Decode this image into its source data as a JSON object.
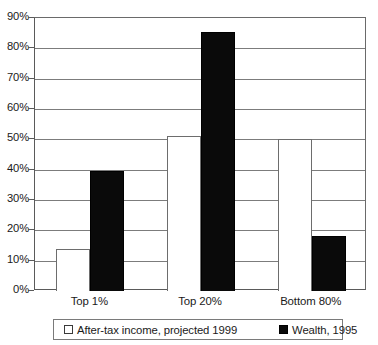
{
  "chart_data": {
    "type": "bar",
    "title": "",
    "subtitle": "",
    "xlabel": "",
    "ylabel": "",
    "categories": [
      "Top 1%",
      "Top 20%",
      "Bottom 80%"
    ],
    "series": [
      {
        "name": "After-tax income, projected 1999",
        "color": "#ffffff",
        "values": [
          14,
          51,
          50
        ]
      },
      {
        "name": "Wealth, 1995",
        "color": "#000000",
        "values": [
          39.5,
          85.5,
          18
        ]
      }
    ],
    "ylim": [
      0,
      90
    ],
    "ytick_values": [
      0,
      10,
      20,
      30,
      40,
      50,
      60,
      70,
      80,
      90
    ],
    "ytick_labels": [
      "0%",
      "10%",
      "20%",
      "30%",
      "40%",
      "50%",
      "60%",
      "70%",
      "80%",
      "90%"
    ],
    "grid": true,
    "legend_position": "bottom"
  },
  "legend": {
    "entries": [
      {
        "label": "After-tax income,  projected 1999",
        "swatch": "light-square-icon"
      },
      {
        "label": "Wealth, 1995",
        "swatch": "dark-square-icon"
      }
    ]
  }
}
